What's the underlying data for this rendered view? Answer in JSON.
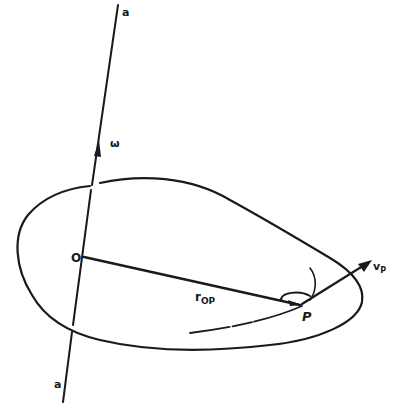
{
  "figure": {
    "type": "rigid-body rotation diagram",
    "labels": {
      "axis_top": "a",
      "axis_bottom": "a",
      "angular_velocity": "ω",
      "origin": "O",
      "position_vector": "r",
      "position_vector_subscript": "OP",
      "point": "P",
      "velocity": "v",
      "velocity_subscript": "P"
    },
    "elements": [
      {
        "name": "rotation-axis",
        "description": "straight line a–a through O"
      },
      {
        "name": "angular-velocity-vector",
        "description": "arrow ω along axis"
      },
      {
        "name": "body-outline",
        "description": "closed blob-shaped rigid body"
      },
      {
        "name": "position-vector",
        "description": "line from O to P labelled r_OP"
      },
      {
        "name": "velocity-vector",
        "description": "arrow v_P at P"
      },
      {
        "name": "path-of-P",
        "description": "curved trajectory of P"
      },
      {
        "name": "right-angle-arc",
        "description": "arc indicating angle between r_OP and v_P"
      }
    ],
    "colors": {
      "ink": "#1a1a1a",
      "background": "#ffffff"
    }
  }
}
